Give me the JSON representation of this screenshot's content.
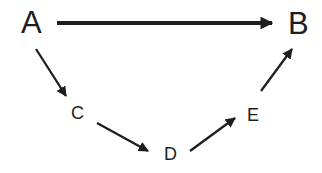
{
  "diagram": {
    "nodes": [
      {
        "id": "A",
        "label": "A"
      },
      {
        "id": "B",
        "label": "B"
      },
      {
        "id": "C",
        "label": "C"
      },
      {
        "id": "D",
        "label": "D"
      },
      {
        "id": "E",
        "label": "E"
      }
    ],
    "edges": [
      {
        "from": "A",
        "to": "B"
      },
      {
        "from": "A",
        "to": "C"
      },
      {
        "from": "C",
        "to": "D"
      },
      {
        "from": "D",
        "to": "E"
      },
      {
        "from": "E",
        "to": "B"
      }
    ],
    "colors": {
      "stroke": "#1e1e1e",
      "background": "#ffffff"
    }
  }
}
